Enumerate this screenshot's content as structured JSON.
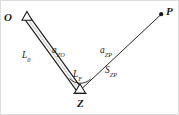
{
  "figure": {
    "background_color": "#ffffff",
    "frame_color": "#dedede",
    "line_color": "#1a1a1a",
    "width": 179,
    "height": 115
  },
  "points": [
    {
      "id": "O",
      "label": "O",
      "marker": "open-triangle",
      "x": 27,
      "y": 17,
      "label_x": 4,
      "label_y": 12
    },
    {
      "id": "Z",
      "label": "Z",
      "marker": "open-triangle",
      "x": 80,
      "y": 90,
      "label_x": 77,
      "label_y": 98
    },
    {
      "id": "P",
      "label": "P",
      "marker": "filled-dot",
      "x": 161,
      "y": 14,
      "label_x": 166,
      "label_y": 6
    }
  ],
  "segments": [
    {
      "id": "OZ",
      "from": "O",
      "to": "Z",
      "style": "double-line",
      "labels": [
        {
          "id": "L0",
          "base": "L",
          "sub": "0",
          "text": "L0"
        },
        {
          "id": "aZO",
          "base": "a",
          "sub": "ZO",
          "text": "aZO"
        }
      ]
    },
    {
      "id": "ZP",
      "from": "Z",
      "to": "P",
      "style": "single-line",
      "labels": [
        {
          "id": "aZP",
          "base": "a",
          "sub": "ZP",
          "text": "aZP"
        },
        {
          "id": "SZP",
          "base": "S",
          "sub": "ZP",
          "text": "SZP"
        }
      ]
    }
  ],
  "angle_arc": {
    "id": "LF",
    "vertex": "Z",
    "base": "L",
    "sub": "F",
    "text": "LF"
  },
  "labels": {
    "point_O": "O",
    "point_P": "P",
    "point_Z": "Z",
    "L0_base": "L",
    "L0_sub": "0",
    "aZO_base": "a",
    "aZO_sub": "ZO",
    "aZP_base": "a",
    "aZP_sub": "ZP",
    "SZP_base": "S",
    "SZP_sub": "ZP",
    "LF_base": "L",
    "LF_sub": "F"
  }
}
